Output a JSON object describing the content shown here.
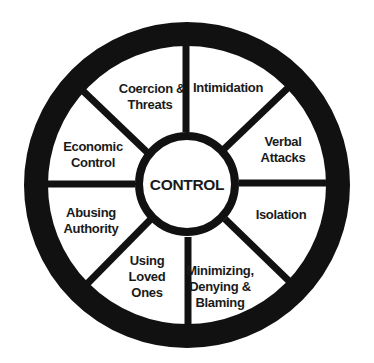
{
  "diagram": {
    "type": "wheel",
    "center_label": "CONTROL",
    "colors": {
      "stroke": "#111111",
      "background": "#ffffff",
      "text": "#1a1a1a"
    },
    "segments": [
      {
        "id": "coercion-threats",
        "lines": [
          "Coercion &",
          "Threats"
        ]
      },
      {
        "id": "intimidation",
        "lines": [
          "Intimidation"
        ]
      },
      {
        "id": "verbal-attacks",
        "lines": [
          "Verbal",
          "Attacks"
        ]
      },
      {
        "id": "isolation",
        "lines": [
          "Isolation"
        ]
      },
      {
        "id": "minimizing-denying-blaming",
        "lines": [
          "Minimizing,",
          "Denying &",
          "Blaming"
        ]
      },
      {
        "id": "using-loved-ones",
        "lines": [
          "Using",
          "Loved",
          "Ones"
        ]
      },
      {
        "id": "abusing-authority",
        "lines": [
          "Abusing",
          "Authority"
        ]
      },
      {
        "id": "economic-control",
        "lines": [
          "Economic",
          "Control"
        ]
      }
    ]
  }
}
